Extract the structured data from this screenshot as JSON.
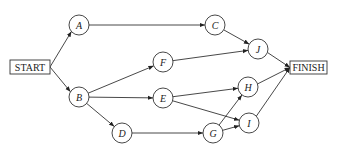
{
  "diagram": {
    "type": "activity-network",
    "terminals": {
      "start": {
        "label": "START",
        "x": 10,
        "y": 60,
        "w": 40,
        "h": 14
      },
      "finish": {
        "label": "FINISH",
        "x": 290,
        "y": 61,
        "w": 37,
        "h": 13
      }
    },
    "node_radius": 10,
    "nodes": [
      {
        "id": "A",
        "label": "A",
        "cx": 79,
        "cy": 25
      },
      {
        "id": "B",
        "label": "B",
        "cx": 79,
        "cy": 97
      },
      {
        "id": "C",
        "label": "C",
        "cx": 215,
        "cy": 25
      },
      {
        "id": "D",
        "label": "D",
        "cx": 122,
        "cy": 133
      },
      {
        "id": "E",
        "label": "E",
        "cx": 163,
        "cy": 98
      },
      {
        "id": "F",
        "label": "F",
        "cx": 163,
        "cy": 62
      },
      {
        "id": "G",
        "label": "G",
        "cx": 213,
        "cy": 133
      },
      {
        "id": "H",
        "label": "H",
        "cx": 248,
        "cy": 87
      },
      {
        "id": "I",
        "label": "I",
        "cx": 249,
        "cy": 123
      },
      {
        "id": "J",
        "label": "J",
        "cx": 258,
        "cy": 49
      }
    ],
    "edges": [
      {
        "from": "START",
        "to": "A"
      },
      {
        "from": "START",
        "to": "B"
      },
      {
        "from": "A",
        "to": "C"
      },
      {
        "from": "B",
        "to": "F"
      },
      {
        "from": "B",
        "to": "E"
      },
      {
        "from": "B",
        "to": "D"
      },
      {
        "from": "C",
        "to": "J"
      },
      {
        "from": "F",
        "to": "J"
      },
      {
        "from": "E",
        "to": "H"
      },
      {
        "from": "E",
        "to": "I"
      },
      {
        "from": "D",
        "to": "G"
      },
      {
        "from": "G",
        "to": "H"
      },
      {
        "from": "G",
        "to": "I"
      },
      {
        "from": "J",
        "to": "FINISH"
      },
      {
        "from": "H",
        "to": "FINISH"
      },
      {
        "from": "I",
        "to": "FINISH"
      }
    ]
  }
}
